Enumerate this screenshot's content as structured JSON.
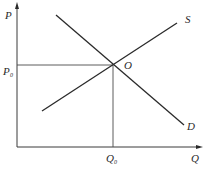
{
  "diagram": {
    "type": "supply-demand",
    "axes": {
      "y_label": "P",
      "x_label": "Q"
    },
    "curves": [
      {
        "name": "S",
        "label": "S",
        "description": "supply curve, upward sloping"
      },
      {
        "name": "D",
        "label": "D",
        "description": "demand curve, downward sloping"
      }
    ],
    "equilibrium": {
      "point_label": "O",
      "price_label": "P",
      "price_subscript": "0",
      "quantity_label": "Q",
      "quantity_subscript": "0"
    }
  }
}
